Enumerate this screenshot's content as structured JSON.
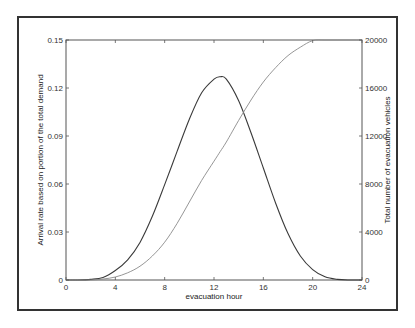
{
  "chart_data": {
    "type": "line",
    "title": "",
    "xlabel": "evacuation hour",
    "ylabel": "Arrival rate based on portion of the total demand",
    "ylabel_right": "Total number of evacuation vehicles",
    "xlim": [
      0,
      24
    ],
    "ylim": [
      0,
      0.15
    ],
    "ylim_right": [
      0,
      20000
    ],
    "x_ticks": [
      "0",
      "4",
      "8",
      "12",
      "16",
      "20",
      "24"
    ],
    "y_ticks": [
      "0",
      "0.03",
      "0.06",
      "0.09",
      "0.12",
      "0.15"
    ],
    "y_ticks_right": [
      "0",
      "4000",
      "8000",
      "12000",
      "16000",
      "20000"
    ],
    "grid": false,
    "legend": null,
    "x": [
      0,
      1,
      2,
      3,
      4,
      5,
      6,
      7,
      8,
      9,
      10,
      11,
      12,
      12.5,
      13,
      14,
      15,
      16,
      17,
      18,
      19,
      20,
      21,
      22,
      23,
      24
    ],
    "series": [
      {
        "name": "Arrival rate (left axis)",
        "axis": "left",
        "color": "#3a3a3a",
        "values": [
          0,
          0,
          0.0004,
          0.0016,
          0.0059,
          0.0126,
          0.0235,
          0.0398,
          0.0596,
          0.0802,
          0.1005,
          0.117,
          0.1255,
          0.127,
          0.1255,
          0.112,
          0.092,
          0.07,
          0.048,
          0.029,
          0.015,
          0.0065,
          0.002,
          0.0004,
          0,
          0
        ]
      },
      {
        "name": "Cumulative evacuation vehicles (right axis)",
        "axis": "right",
        "color": "#8a8a8a",
        "values": [
          0,
          0,
          0,
          80,
          250,
          600,
          1150,
          2000,
          3150,
          4700,
          6500,
          8300,
          9900,
          10700,
          11500,
          13300,
          15000,
          16500,
          17700,
          18700,
          19400,
          19950,
          20000,
          20000,
          20000,
          20000
        ]
      }
    ]
  }
}
